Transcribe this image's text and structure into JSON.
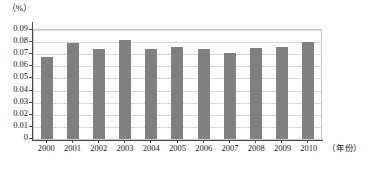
{
  "chart_data": {
    "type": "bar",
    "title": "",
    "subtitle": "",
    "xlabel": "（年份）",
    "ylabel": "（%）",
    "categories": [
      "2000",
      "2001",
      "2002",
      "2003",
      "2004",
      "2005",
      "2006",
      "2007",
      "2008",
      "2009",
      "2010"
    ],
    "values": [
      0.068,
      0.079,
      0.074,
      0.082,
      0.074,
      0.076,
      0.074,
      0.071,
      0.075,
      0.076,
      0.08
    ],
    "series": [
      {
        "name": "",
        "values": [
          0.068,
          0.079,
          0.074,
          0.082,
          0.074,
          0.076,
          0.074,
          0.071,
          0.075,
          0.076,
          0.08
        ]
      }
    ],
    "ylim": [
      0,
      0.09
    ],
    "ytick_values": [
      0,
      0.01,
      0.02,
      0.03,
      0.04,
      0.05,
      0.06,
      0.07,
      0.08,
      0.09
    ],
    "ytick_labels": [
      "0",
      "0.01",
      "0.02",
      "0.03",
      "0.04",
      "0.05",
      "0.06",
      "0.07",
      "0.08",
      "0.09"
    ],
    "grid": true,
    "grid_axis": "y",
    "legend": false,
    "legend_position": "none",
    "bar_color": "#808080",
    "gridline_color": "#d9d9d9",
    "axis_color": "#4a4a4a",
    "plot_border_color": "#c8c8c8",
    "background_color": "#ffffff",
    "annotations": []
  }
}
